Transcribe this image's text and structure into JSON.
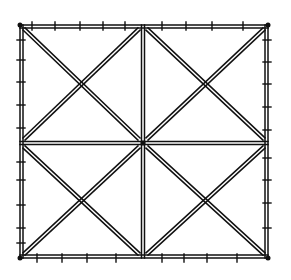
{
  "diagram": {
    "type": "braced-square-frame-line-drawing",
    "frame": {
      "x0": 20,
      "y0": 25,
      "x1": 268,
      "y1": 258
    },
    "center": {
      "x": 143,
      "y": 143
    },
    "grid": {
      "rows": 2,
      "cols": 2
    },
    "double_line_gap": 3,
    "stroke_color": "#111111",
    "background_color": "#ffffff",
    "ticks": {
      "top": [
        32,
        55,
        80,
        103,
        125,
        162,
        186,
        212,
        243
      ],
      "bottom": [
        37,
        62,
        87,
        116,
        162,
        184,
        207,
        237
      ],
      "left": [
        40,
        60,
        82,
        105,
        128,
        162,
        180,
        205,
        228,
        243
      ],
      "right": [
        40,
        62,
        84,
        107,
        130,
        158,
        180,
        203,
        228
      ]
    }
  }
}
